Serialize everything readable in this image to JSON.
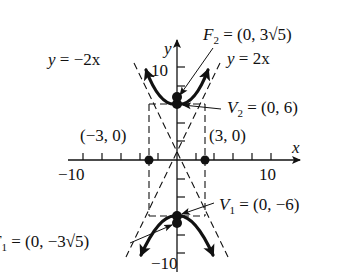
{
  "diagram": {
    "type": "hyperbola-graph",
    "equation_implied": "y^2/36 - x^2/9 = 1",
    "axes": {
      "x_label": "x",
      "y_label": "y",
      "x_ticks": {
        "min_label": "−10",
        "max_label": "10"
      },
      "y_ticks": {
        "max_label": "10",
        "min_label": "−10"
      },
      "range": {
        "x": [
          -10,
          10
        ],
        "y": [
          -10,
          10
        ]
      },
      "tick_step": 2
    },
    "labels": {
      "asymptote_neg": {
        "lhs": "y",
        "rhs": " = −2x"
      },
      "asymptote_pos": {
        "lhs": "y",
        "rhs": " = 2x"
      },
      "focus_upper": {
        "name": "F",
        "sub": "2",
        "value": " = (0, 3√5)"
      },
      "focus_lower": {
        "name": "F",
        "sub": "1",
        "value": " = (0, −3√5)"
      },
      "vertex_upper": {
        "name": "V",
        "sub": "2",
        "value": " = (0, 6)"
      },
      "vertex_lower": {
        "name": "V",
        "sub": "1",
        "value": " = (0, −6)"
      },
      "point_left": "(−3, 0)",
      "point_right": "(3, 0)"
    },
    "points": [
      {
        "name": "V2",
        "x": 0,
        "y": 6
      },
      {
        "name": "V1",
        "x": 0,
        "y": -6
      },
      {
        "name": "F2",
        "x": 0,
        "y": 6.708
      },
      {
        "name": "F1",
        "x": 0,
        "y": -6.708
      },
      {
        "name": "co-vertex-left",
        "x": -3,
        "y": 0
      },
      {
        "name": "co-vertex-right",
        "x": 3,
        "y": 0
      }
    ],
    "colors": {
      "ink": "#111111",
      "background": "#ffffff"
    }
  }
}
